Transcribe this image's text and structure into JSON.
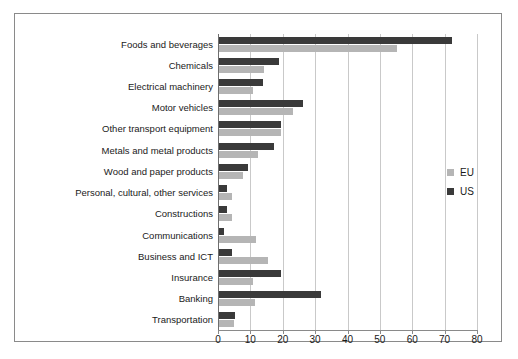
{
  "chart_data": {
    "type": "bar",
    "orientation": "horizontal",
    "title": "",
    "xlabel": "",
    "ylabel": "",
    "xlim": [
      0,
      80
    ],
    "xticks": [
      0,
      10,
      20,
      30,
      40,
      50,
      60,
      70,
      80
    ],
    "grid": true,
    "legend_position": "right",
    "categories": [
      "Foods and beverages",
      "Chemicals",
      "Electrical machinery",
      "Motor vehicles",
      "Other transport equipment",
      "Metals and metal products",
      "Wood and paper products",
      "Personal, cultural, other services",
      "Constructions",
      "Communications",
      "Business and ICT",
      "Insurance",
      "Banking",
      "Transportation"
    ],
    "series": [
      {
        "name": "US",
        "color": "#3a3a3a",
        "values": [
          72,
          18.5,
          13.5,
          26,
          19,
          17,
          9,
          2.5,
          2.5,
          1.5,
          4,
          19,
          31.5,
          5
        ]
      },
      {
        "name": "EU",
        "color": "#b5b5b5",
        "values": [
          55,
          14,
          10.5,
          23,
          19,
          12,
          7.5,
          4,
          4,
          11.5,
          15,
          10.5,
          11,
          4.5
        ]
      }
    ]
  },
  "legend": {
    "entries": [
      {
        "label": "EU",
        "color": "#b5b5b5"
      },
      {
        "label": "US",
        "color": "#3a3a3a"
      }
    ]
  }
}
